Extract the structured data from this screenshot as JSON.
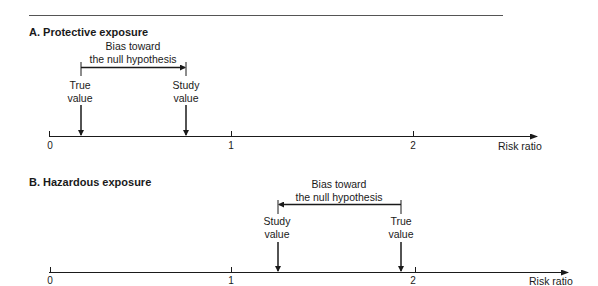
{
  "panels": [
    {
      "title": "A. Protective exposure",
      "bias_label_line1": "Bias toward",
      "bias_label_line2": "the null hypothesis",
      "bias_direction": "right",
      "markers": [
        {
          "label_line1": "True",
          "label_line2": "value",
          "risk_ratio": 0.17
        },
        {
          "label_line1": "Study",
          "label_line2": "value",
          "risk_ratio": 0.75
        }
      ],
      "axis": {
        "ticks": [
          "0",
          "1",
          "2"
        ],
        "label": "Risk ratio"
      }
    },
    {
      "title": "B. Hazardous exposure",
      "bias_label_line1": "Bias toward",
      "bias_label_line2": "the null hypothesis",
      "bias_direction": "left",
      "markers": [
        {
          "label_line1": "Study",
          "label_line2": "value",
          "risk_ratio": 1.25
        },
        {
          "label_line1": "True",
          "label_line2": "value",
          "risk_ratio": 1.93
        }
      ],
      "axis": {
        "ticks": [
          "0",
          "1",
          "2"
        ],
        "label": "Risk ratio"
      }
    }
  ],
  "colors": {
    "line": "#1a1a1a",
    "rule": "#555555"
  }
}
